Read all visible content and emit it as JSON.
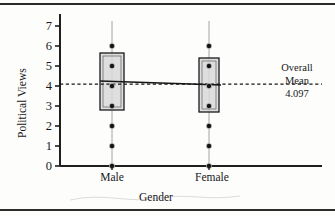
{
  "figure": {
    "background": "#fdfdfc",
    "frame_color": "#2b2b2b"
  },
  "annotation": {
    "line1": "Overall",
    "line2": "Mean",
    "line3": "4.097"
  },
  "chart_data": {
    "type": "box",
    "title": "",
    "xlabel": "Gender",
    "ylabel": "Political Views",
    "categories": [
      "Male",
      "Female"
    ],
    "ylim": [
      0,
      7.6
    ],
    "yticks": [
      0,
      1,
      2,
      3,
      4,
      5,
      6,
      7
    ],
    "ytick_labels": [
      "0",
      "1",
      "2",
      "3",
      "4",
      "5",
      "6",
      "7"
    ],
    "grid": false,
    "legend": "none",
    "overall_mean": 4.097,
    "overall_mean_label": "Overall Mean 4.097",
    "mean_line_style": "dashed",
    "connect_line_style": "solid",
    "boxes": [
      {
        "category": "Male",
        "q1": 2.8,
        "q3": 5.65,
        "median": 4.25,
        "group_mean": 4.25,
        "whisker_low": 0.0,
        "whisker_high": 7.0,
        "box_fill": "#d8d8d8",
        "box_edge": "#1a1a1a",
        "points": [
          0,
          1,
          2,
          3,
          4,
          5,
          6
        ]
      },
      {
        "category": "Female",
        "q1": 2.7,
        "q3": 5.4,
        "median": 4.05,
        "group_mean": 4.05,
        "whisker_low": 0.0,
        "whisker_high": 7.0,
        "box_fill": "#d8d8d8",
        "box_edge": "#1a1a1a",
        "points": [
          0,
          1,
          2,
          3,
          4,
          5,
          6
        ]
      }
    ],
    "point_color": "#161616",
    "axis_color": "#1f1f1f"
  }
}
